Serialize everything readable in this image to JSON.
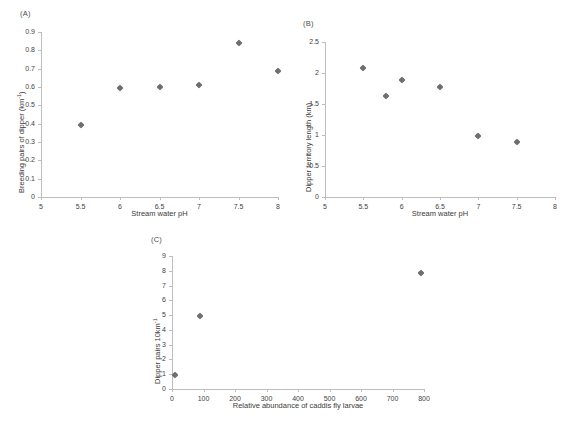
{
  "figure": {
    "background": "#ffffff",
    "marker_color": "#6e6e6e",
    "axis_color": "#bdbdbd",
    "text_color": "#3a3a3a"
  },
  "panels": [
    {
      "label": "(A)",
      "name": "panel-a"
    },
    {
      "label": "(B)",
      "name": "panel-b"
    },
    {
      "label": "(C)",
      "name": "panel-c"
    }
  ],
  "chart_data": [
    {
      "type": "scatter",
      "panel": "(A)",
      "title": "",
      "xlabel": "Stream water pH",
      "ylabel": "Breeding pairs of dipper (km⁻¹)",
      "ylabel_parts": {
        "main": "Breeding pairs of dipper (km",
        "sup": "-1",
        "tail": ")"
      },
      "xlim": [
        5,
        8
      ],
      "ylim": [
        0,
        0.9
      ],
      "xticks": [
        5,
        5.5,
        6,
        6.5,
        7,
        7.5,
        8
      ],
      "xticklabels": [
        "5",
        "5.5",
        "6",
        "6.5",
        "7",
        "7.5",
        "8"
      ],
      "yticks": [
        0,
        0.1,
        0.2,
        0.3,
        0.4,
        0.5,
        0.6,
        0.7,
        0.8,
        0.9
      ],
      "yticklabels": [
        "0",
        "0.1",
        "0.2",
        "0.3",
        "0.4",
        "0.5",
        "0.6",
        "0.7",
        "0.8",
        "0.9"
      ],
      "grid": false,
      "legend": "none",
      "x": [
        5.5,
        6.0,
        6.5,
        7.0,
        7.5,
        8.0
      ],
      "y": [
        0.395,
        0.595,
        0.6,
        0.61,
        0.84,
        0.685
      ]
    },
    {
      "type": "scatter",
      "panel": "(B)",
      "title": "",
      "xlabel": "Stream water pH",
      "ylabel": "Dipper territory length (km)",
      "ylabel_parts": {
        "main": "Dipper territory length (km)",
        "sup": "",
        "tail": ""
      },
      "xlim": [
        5,
        8
      ],
      "ylim": [
        0,
        2.5
      ],
      "xticks": [
        5,
        5.5,
        6,
        6.5,
        7,
        7.5,
        8
      ],
      "xticklabels": [
        "5",
        "5.5",
        "6",
        "6.5",
        "7",
        "7.5",
        "8"
      ],
      "yticks": [
        0,
        0.5,
        1,
        1.5,
        2,
        2.5
      ],
      "yticklabels": [
        "0",
        "0.5",
        "1",
        "1.5",
        "2",
        "2.5"
      ],
      "grid": false,
      "legend": "none",
      "x": [
        5.5,
        5.8,
        6.0,
        6.5,
        7.0,
        7.5
      ],
      "y": [
        2.08,
        1.63,
        1.88,
        1.78,
        0.98,
        0.88
      ]
    },
    {
      "type": "scatter",
      "panel": "(C)",
      "title": "",
      "xlabel": "Relative abundance of caddis fly larvae",
      "ylabel": "Dipper pairs 10km⁻¹",
      "ylabel_parts": {
        "main": "Dipper pairs 10km",
        "sup": "-1",
        "tail": ""
      },
      "xlim": [
        0,
        800
      ],
      "ylim": [
        0,
        9
      ],
      "xticks": [
        0,
        100,
        200,
        300,
        400,
        500,
        600,
        700,
        800
      ],
      "xticklabels": [
        "0",
        "100",
        "200",
        "300",
        "400",
        "500",
        "600",
        "700",
        "800"
      ],
      "yticks": [
        0,
        1,
        2,
        3,
        4,
        5,
        6,
        7,
        8,
        9
      ],
      "yticklabels": [
        "0",
        "1",
        "2",
        "3",
        "4",
        "5",
        "6",
        "7",
        "8",
        "9"
      ],
      "grid": false,
      "legend": "none",
      "x": [
        8,
        90,
        790
      ],
      "y": [
        0.97,
        4.95,
        7.85
      ]
    }
  ]
}
